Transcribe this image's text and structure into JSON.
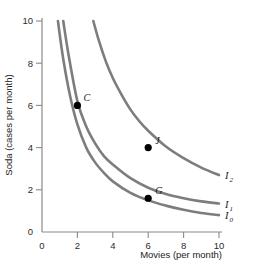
{
  "chart_data": {
    "type": "line",
    "title": "",
    "xlabel": "Movies (per month)",
    "ylabel": "Soda (cases per month)",
    "xlim": [
      0,
      10
    ],
    "ylim": [
      0,
      10
    ],
    "xticks": [
      0,
      2,
      4,
      6,
      8,
      10
    ],
    "yticks": [
      0,
      2,
      4,
      6,
      8,
      10
    ],
    "xtick_labels": [
      "0",
      "2",
      "4",
      "6",
      "8",
      "10"
    ],
    "ytick_labels": [
      "0",
      "2",
      "4",
      "6",
      "8",
      "10"
    ],
    "grid": false,
    "legend_position": "inline-right",
    "curve_color": "#7d7d7d",
    "point_color": "#000000",
    "axis_color": "#8a8a8a",
    "series": [
      {
        "name": "I0",
        "label": "I",
        "sublabel": "0",
        "constant": 3.2,
        "x": [
          0.9,
          1.2,
          1.6,
          2.0,
          2.5,
          3.0,
          3.5,
          4.0,
          5.0,
          6.0,
          7.0,
          8.0,
          9.0,
          10.0
        ],
        "y": [
          10.0,
          8.2,
          6.4,
          5.1,
          4.0,
          3.3,
          2.8,
          2.4,
          1.85,
          1.5,
          1.25,
          1.05,
          0.9,
          0.8
        ]
      },
      {
        "name": "I1",
        "label": "I",
        "sublabel": "1",
        "constant": 4.4,
        "x": [
          1.2,
          1.5,
          2.0,
          2.5,
          3.0,
          3.5,
          4.0,
          5.0,
          6.0,
          7.0,
          8.0,
          9.0,
          10.0
        ],
        "y": [
          10.0,
          8.4,
          6.2,
          5.0,
          4.2,
          3.6,
          3.2,
          2.55,
          2.1,
          1.8,
          1.6,
          1.45,
          1.35
        ]
      },
      {
        "name": "I2",
        "label": "I",
        "sublabel": "2",
        "constant": 12.0,
        "x": [
          2.9,
          3.2,
          3.6,
          4.0,
          4.5,
          5.0,
          5.5,
          6.0,
          7.0,
          8.0,
          9.0,
          10.0
        ],
        "y": [
          10.0,
          9.1,
          8.1,
          7.3,
          6.5,
          5.8,
          5.25,
          4.8,
          4.05,
          3.5,
          3.05,
          2.7
        ]
      }
    ],
    "points": [
      {
        "name": "C",
        "label": "C",
        "x": 2.0,
        "y": 6.0,
        "on_curve": "I1",
        "label_dx": 6,
        "label_dy": -4
      },
      {
        "name": "J",
        "label": "J",
        "x": 6.0,
        "y": 4.0,
        "on_curve": "I2",
        "label_dx": 7,
        "label_dy": -4
      },
      {
        "name": "G",
        "label": "G",
        "x": 6.0,
        "y": 1.6,
        "on_curve": "I1",
        "label_dx": 7,
        "label_dy": -4
      }
    ]
  }
}
